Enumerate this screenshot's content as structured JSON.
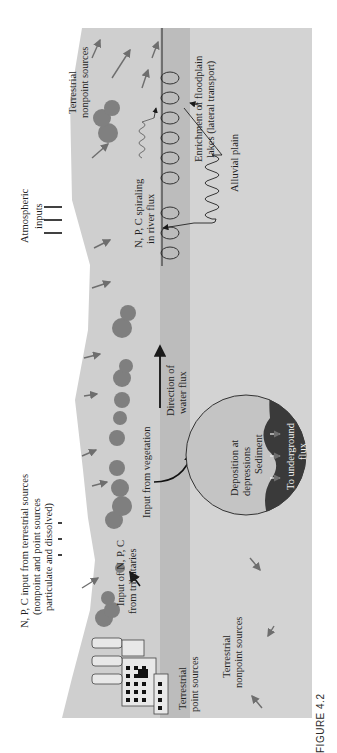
{
  "figure": {
    "caption": "FIGURE 4.2",
    "orientation": "rotated 90° counter-clockwise"
  },
  "labels": {
    "atmospheric_inputs": [
      "Atmospheric",
      "inputs"
    ],
    "npc_input_terrestrial": [
      "N, P, C input from terrestrial sources",
      "(nonpoint and point sources",
      "particulate and dissolved)"
    ],
    "terrestrial_nonpoint_upper": [
      "Terrestrial",
      "nonpoint sources"
    ],
    "terrestrial_nonpoint_lower": [
      "Terrestrial",
      "nonpoint sources"
    ],
    "terrestrial_point": [
      "Terrestrial",
      "point sources"
    ],
    "input_tributaries": [
      "Input of N, P, C",
      "from tributaries"
    ],
    "input_vegetation": "Input from vegetation",
    "direction_water_flux": [
      "Direction of",
      "water flux"
    ],
    "npc_spiraling": [
      "N, P, C spiraling",
      "in river flux"
    ],
    "enrichment_floodplain": [
      "Enrichment of floodplain",
      "lakes (lateral transport)"
    ],
    "alluvial_plain": "Alluvial plain",
    "deposition": [
      "Deposition at",
      "depressions"
    ],
    "sediment": "Sediment",
    "underground_flux": [
      "To underground",
      "flux"
    ]
  },
  "colors": {
    "background": "#ffffff",
    "terrain": "#cfcfcf",
    "river": "#bdbdbd",
    "floodplain": "#d4d4d4",
    "tree": "#7a7a7a",
    "arrow": "#6e6e6e",
    "ink": "#1f1f1f",
    "circle_light": "#c2c2c2",
    "circle_dark": "#3a3a3a"
  }
}
